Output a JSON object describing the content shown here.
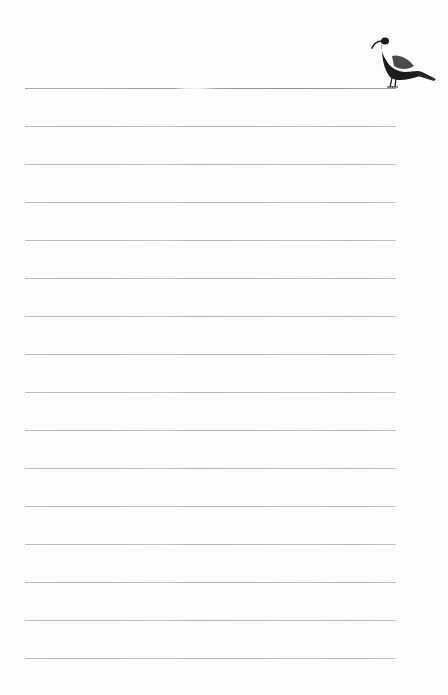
{
  "document": {
    "type": "lined-notepaper",
    "background_color": "#fdfdfd",
    "header_bleed_text": "",
    "illustration": {
      "icon": "bird-icon",
      "description": "dark long-billed bird standing on the top rule",
      "color": "#1c1c1c",
      "wing_color": "#4a4a4a"
    },
    "rules": {
      "count": 16,
      "color": "#b8b8b8",
      "first_rule_color": "#9a9a9a",
      "start_y": 88,
      "spacing": 38,
      "left": 25,
      "right": 396
    },
    "lines": [
      {
        "text": ""
      },
      {
        "text": ""
      },
      {
        "text": ""
      },
      {
        "text": ""
      },
      {
        "text": ""
      },
      {
        "text": ""
      },
      {
        "text": ""
      },
      {
        "text": ""
      },
      {
        "text": ""
      },
      {
        "text": ""
      },
      {
        "text": ""
      },
      {
        "text": ""
      },
      {
        "text": ""
      },
      {
        "text": ""
      },
      {
        "text": ""
      },
      {
        "text": ""
      }
    ]
  }
}
